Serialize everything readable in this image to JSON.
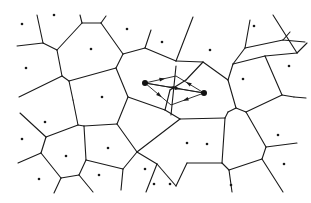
{
  "diagram": {
    "type": "voronoi",
    "width": 311,
    "height": 203,
    "colors": {
      "edge": "#1a1a1a",
      "site": "#1a1a1a",
      "background": "#ffffff"
    },
    "edges": [
      [
        [
          37,
          15
        ],
        [
          43,
          43
        ]
      ],
      [
        [
          17,
          46
        ],
        [
          43,
          43
        ]
      ],
      [
        [
          43,
          43
        ],
        [
          57,
          50
        ]
      ],
      [
        [
          57,
          50
        ],
        [
          82,
          23
        ]
      ],
      [
        [
          82,
          23
        ],
        [
          80,
          15
        ]
      ],
      [
        [
          82,
          23
        ],
        [
          101,
          23
        ]
      ],
      [
        [
          101,
          23
        ],
        [
          106,
          16
        ]
      ],
      [
        [
          101,
          23
        ],
        [
          123,
          54
        ]
      ],
      [
        [
          123,
          54
        ],
        [
          116,
          68
        ]
      ],
      [
        [
          123,
          54
        ],
        [
          145,
          48
        ]
      ],
      [
        [
          145,
          48
        ],
        [
          151,
          30
        ]
      ],
      [
        [
          57,
          50
        ],
        [
          62,
          76
        ]
      ],
      [
        [
          62,
          76
        ],
        [
          19,
          97
        ]
      ],
      [
        [
          62,
          76
        ],
        [
          69,
          81
        ]
      ],
      [
        [
          69,
          81
        ],
        [
          116,
          68
        ]
      ],
      [
        [
          69,
          81
        ],
        [
          73,
          100
        ]
      ],
      [
        [
          116,
          68
        ],
        [
          128,
          97
        ]
      ],
      [
        [
          145,
          48
        ],
        [
          176,
          61
        ]
      ],
      [
        [
          176,
          61
        ],
        [
          193,
          17
        ]
      ],
      [
        [
          176,
          61
        ],
        [
          203,
          62
        ]
      ],
      [
        [
          203,
          62
        ],
        [
          228,
          80
        ]
      ],
      [
        [
          228,
          80
        ],
        [
          233,
          64
        ]
      ],
      [
        [
          233,
          64
        ],
        [
          245,
          48
        ]
      ],
      [
        [
          245,
          48
        ],
        [
          250,
          20
        ]
      ],
      [
        [
          245,
          48
        ],
        [
          283,
          40
        ]
      ],
      [
        [
          283,
          40
        ],
        [
          290,
          32
        ]
      ],
      [
        [
          283,
          40
        ],
        [
          305,
          42
        ]
      ],
      [
        [
          233,
          64
        ],
        [
          265,
          56
        ]
      ],
      [
        [
          265,
          56
        ],
        [
          297,
          53
        ]
      ],
      [
        [
          297,
          53
        ],
        [
          273,
          15
        ]
      ],
      [
        [
          297,
          53
        ],
        [
          307,
          43
        ]
      ],
      [
        [
          265,
          56
        ],
        [
          282,
          95
        ]
      ],
      [
        [
          282,
          95
        ],
        [
          294,
          97
        ]
      ],
      [
        [
          294,
          97
        ],
        [
          306,
          98
        ]
      ],
      [
        [
          203,
          62
        ],
        [
          186,
          80
        ]
      ],
      [
        [
          186,
          80
        ],
        [
          170,
          90
        ]
      ],
      [
        [
          170,
          90
        ],
        [
          165,
          110
        ]
      ],
      [
        [
          228,
          80
        ],
        [
          236,
          108
        ]
      ],
      [
        [
          236,
          108
        ],
        [
          246,
          112
        ]
      ],
      [
        [
          246,
          112
        ],
        [
          282,
          95
        ]
      ],
      [
        [
          236,
          108
        ],
        [
          228,
          112
        ]
      ],
      [
        [
          73,
          100
        ],
        [
          78,
          125
        ]
      ],
      [
        [
          78,
          125
        ],
        [
          46,
          137
        ]
      ],
      [
        [
          78,
          125
        ],
        [
          84,
          126
        ]
      ],
      [
        [
          84,
          126
        ],
        [
          117,
          124
        ]
      ],
      [
        [
          117,
          124
        ],
        [
          128,
          97
        ]
      ],
      [
        [
          128,
          97
        ],
        [
          165,
          110
        ]
      ],
      [
        [
          46,
          137
        ],
        [
          20,
          113
        ]
      ],
      [
        [
          46,
          137
        ],
        [
          41,
          153
        ]
      ],
      [
        [
          41,
          153
        ],
        [
          18,
          163
        ]
      ],
      [
        [
          41,
          153
        ],
        [
          61,
          178
        ]
      ],
      [
        [
          61,
          178
        ],
        [
          79,
          175
        ]
      ],
      [
        [
          79,
          175
        ],
        [
          86,
          160
        ]
      ],
      [
        [
          86,
          160
        ],
        [
          84,
          126
        ]
      ],
      [
        [
          61,
          178
        ],
        [
          54,
          193
        ]
      ],
      [
        [
          79,
          175
        ],
        [
          93,
          192
        ]
      ],
      [
        [
          86,
          160
        ],
        [
          123,
          169
        ]
      ],
      [
        [
          123,
          169
        ],
        [
          137,
          152
        ]
      ],
      [
        [
          137,
          152
        ],
        [
          117,
          124
        ]
      ],
      [
        [
          123,
          169
        ],
        [
          121,
          190
        ]
      ],
      [
        [
          137,
          152
        ],
        [
          180,
          119
        ]
      ],
      [
        [
          180,
          119
        ],
        [
          165,
          110
        ]
      ],
      [
        [
          180,
          119
        ],
        [
          225,
          118
        ]
      ],
      [
        [
          225,
          118
        ],
        [
          228,
          112
        ]
      ],
      [
        [
          225,
          118
        ],
        [
          222,
          163
        ]
      ],
      [
        [
          137,
          152
        ],
        [
          157,
          164
        ]
      ],
      [
        [
          157,
          164
        ],
        [
          176,
          186
        ]
      ],
      [
        [
          176,
          186
        ],
        [
          187,
          163
        ]
      ],
      [
        [
          187,
          163
        ],
        [
          222,
          163
        ]
      ],
      [
        [
          222,
          163
        ],
        [
          229,
          170
        ]
      ],
      [
        [
          229,
          170
        ],
        [
          232,
          192
        ]
      ],
      [
        [
          229,
          170
        ],
        [
          262,
          159
        ]
      ],
      [
        [
          262,
          159
        ],
        [
          283,
          192
        ]
      ],
      [
        [
          262,
          159
        ],
        [
          266,
          147
        ]
      ],
      [
        [
          266,
          147
        ],
        [
          246,
          112
        ]
      ],
      [
        [
          266,
          147
        ],
        [
          297,
          143
        ]
      ],
      [
        [
          157,
          164
        ],
        [
          146,
          192
        ]
      ]
    ],
    "sites": [
      [
        22,
        24
      ],
      [
        54,
        15
      ],
      [
        26,
        68
      ],
      [
        91,
        49
      ],
      [
        127,
        29
      ],
      [
        102,
        97
      ],
      [
        162,
        42
      ],
      [
        210,
        50
      ],
      [
        254,
        26
      ],
      [
        289,
        66
      ],
      [
        243,
        79
      ],
      [
        45,
        122
      ],
      [
        22,
        139
      ],
      [
        66,
        156
      ],
      [
        39,
        179
      ],
      [
        108,
        148
      ],
      [
        99,
        175
      ],
      [
        145,
        169
      ],
      [
        187,
        143
      ],
      [
        207,
        144
      ],
      [
        170,
        184
      ],
      [
        231,
        185
      ],
      [
        278,
        135
      ],
      [
        284,
        164
      ],
      [
        154,
        184
      ]
    ],
    "highlight": {
      "nodes": [
        [
          145,
          83
        ],
        [
          204,
          93
        ]
      ],
      "mid_vertices": [
        [
          176,
          76
        ],
        [
          171,
          105
        ]
      ],
      "arrows": [
        {
          "from": [
            145,
            83
          ],
          "to": [
            176,
            76
          ]
        },
        {
          "from": [
            145,
            83
          ],
          "to": [
            204,
            93
          ]
        },
        {
          "from": [
            145,
            83
          ],
          "to": [
            171,
            105
          ]
        },
        {
          "from": [
            204,
            93
          ],
          "to": [
            176,
            76
          ]
        },
        {
          "from": [
            204,
            93
          ],
          "to": [
            145,
            83
          ]
        },
        {
          "from": [
            204,
            93
          ],
          "to": [
            171,
            105
          ]
        }
      ]
    }
  }
}
